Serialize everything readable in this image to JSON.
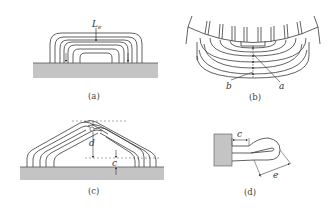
{
  "figure": {
    "panels": [
      {
        "id": "a",
        "caption": "(a)",
        "labels": {
          "length": "L",
          "length_sub": "e"
        }
      },
      {
        "id": "b",
        "caption": "(b)",
        "labels": {
          "left": "b",
          "right": "a"
        }
      },
      {
        "id": "c",
        "caption": "(c)",
        "labels": {
          "apex_gap": "d",
          "base_gap": "c"
        }
      },
      {
        "id": "d",
        "caption": "(d)",
        "labels": {
          "straight": "c",
          "bend": "e"
        }
      }
    ],
    "colors": {
      "line": "#3a3a3a",
      "substrate": "#c4c4c4",
      "background": "#ffffff"
    }
  }
}
